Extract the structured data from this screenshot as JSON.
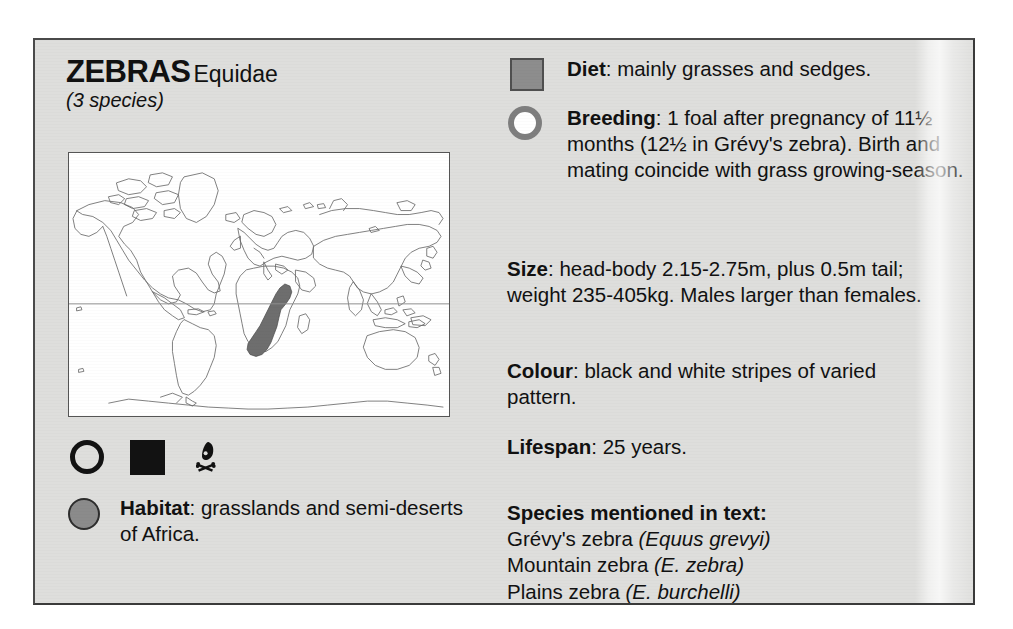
{
  "panel": {
    "heading": {
      "title": "ZEBRAS",
      "family": "Equidae",
      "subtitle": "(3 species)"
    },
    "map": {
      "name": "world-distribution-map",
      "caption_equator": "equator",
      "range_region": "eastern and southern Africa"
    },
    "icon_strip": [
      {
        "name": "ring-outline-icon",
        "glyph": "circle-outline"
      },
      {
        "name": "filled-square-icon",
        "glyph": "square-filled"
      },
      {
        "name": "skull-and-crossbones-icon",
        "glyph": "skull"
      }
    ],
    "habitat": {
      "icon": "filled-circle-icon",
      "lead": "Habitat",
      "text": ": grasslands and semi-deserts of Africa."
    },
    "facts": [
      {
        "key": "diet",
        "icon": "grey-square-icon",
        "lead": "Diet",
        "text": ": mainly grasses and sedges."
      },
      {
        "key": "breeding",
        "icon": "grey-ring-icon",
        "lead": "Breeding",
        "text": ": 1 foal after pregnancy of 11½ months (12½ in Grévy's zebra). Birth and mating coincide with grass growing-season."
      },
      {
        "key": "size",
        "icon": null,
        "lead": "Size",
        "text": ": head-body 2.15-2.75m, plus 0.5m tail; weight 235-405kg. Males larger than females."
      },
      {
        "key": "colour",
        "icon": null,
        "lead": "Colour",
        "text": ": black and white stripes of varied pattern."
      },
      {
        "key": "lifespan",
        "icon": null,
        "lead": "Lifespan",
        "text": ": 25 years."
      }
    ],
    "species": {
      "heading": "Species mentioned in text:",
      "items": [
        {
          "common": "Grévy's zebra ",
          "scientific": "(Equus grevyi)"
        },
        {
          "common": "Mountain zebra ",
          "scientific": "(E. zebra)"
        },
        {
          "common": "Plains zebra ",
          "scientific": "(E. burchelli)"
        }
      ]
    }
  },
  "colors": {
    "panel_background": "#dededc",
    "panel_border": "#4a4a4a",
    "text": "#111111",
    "icon_grey": "#8d8d8d",
    "icon_black": "#121212",
    "map_background": "#ffffff",
    "map_range_fill": "#6e6e6e",
    "map_outline": "#6a6a6a"
  }
}
